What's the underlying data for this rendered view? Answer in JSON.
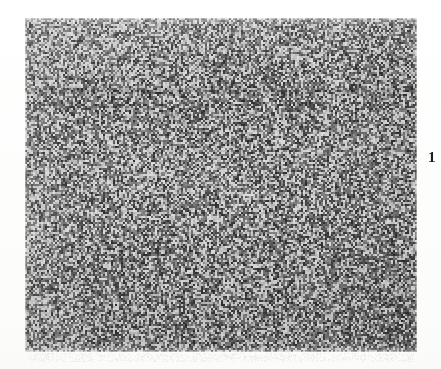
{
  "page": {
    "kind": "scanned-journal-figure-page",
    "background_color": "#fefefe",
    "width": 441,
    "height": 369
  },
  "figure": {
    "label": "1",
    "label_position": "right-margin",
    "caption": "",
    "image": {
      "alt_name": "halftone-micrograph-plate",
      "x": 25,
      "y": 18,
      "width": 392,
      "height": 334,
      "appearance": "dense random halftone speckle, dark-gray field with light and dark grains",
      "base_color": "#6d6d6d",
      "light_grain_color": "#dcdcdc",
      "mid_grain_color": "#7a7a7a",
      "dark_grain_color": "#3a3a3a",
      "grain_size_px": 2,
      "light_fraction": 0.34,
      "dark_fraction": 0.3,
      "artifacts": {
        "horizontal_band_y": 86,
        "brighter_corner": "top-left"
      }
    }
  },
  "margins": {
    "scan_residue_visible": true
  }
}
